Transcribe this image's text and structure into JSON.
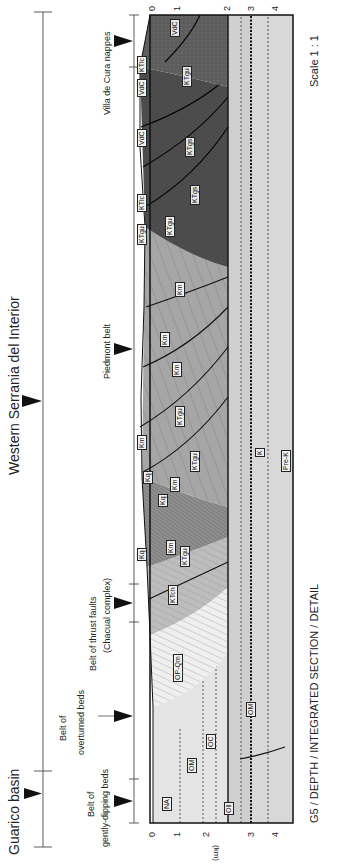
{
  "figure": {
    "caption": "G5 / DEPTH / INTEGRATED SECTION / DETAIL",
    "scale": "Scale 1 : 1",
    "orientation": "rotated 90° counter-clockwise"
  },
  "regions": {
    "major": [
      {
        "label": "Guarico basin"
      },
      {
        "label": "Western Serrania del Interior"
      }
    ],
    "belts": [
      {
        "label_line1": "Belt of",
        "label_line2": "gently-dipping beds"
      },
      {
        "label_line1": "Belt of",
        "label_line2": "overturned beds"
      },
      {
        "label_line1": "Belt of thrust faults",
        "label_line2": "(Chacual complex)"
      },
      {
        "label_line1": "Piedmont belt",
        "label_line2": ""
      },
      {
        "label_line1": "Villa de Cura nappes",
        "label_line2": ""
      }
    ]
  },
  "depth_axis": {
    "unit": "(km)",
    "ticks": [
      "0",
      "1",
      "2",
      "3",
      "4"
    ]
  },
  "formation_labels": {
    "surface": [
      "Kq",
      "Km",
      "Kq",
      "KTgu",
      "KTlc",
      "VdC",
      "VdC",
      "KTlc"
    ],
    "section": [
      "NA",
      "OM",
      "OC",
      "OP-Qm",
      "KTch",
      "KTgu",
      "Km",
      "Kq",
      "Km",
      "KTgu",
      "KTgu",
      "Km",
      "Km",
      "Km",
      "KTgu",
      "KTgs",
      "KTgs",
      "KTgu",
      "VdC"
    ],
    "subsurface": [
      "Oll",
      "OM",
      "K",
      "Pre-K"
    ]
  },
  "colors": {
    "background": "#ffffff",
    "basement_light": "#d6d6d6",
    "basement_mid": "#c4c4c4",
    "cover_light": "#e6e6e6",
    "piedmont_mid": "#9a9a9a",
    "thrust_dark": "#5a5a5a",
    "villa_de_cura": "#4a4a4a",
    "line": "#111111"
  }
}
